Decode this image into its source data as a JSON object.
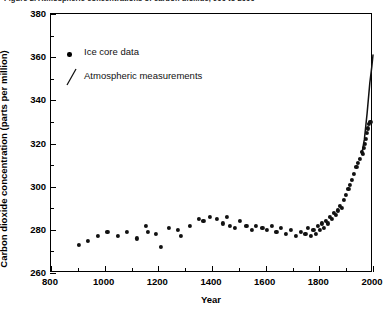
{
  "figure": {
    "title": "Figure 2. Atmospheric concentrations of carbon dioxide, 900 to 2000"
  },
  "legend": {
    "position": "top-left",
    "entries": [
      {
        "label": "Ice core data",
        "marker": "dot-marker-icon"
      },
      {
        "label": "Atmospheric measurements",
        "marker": "line-marker-icon"
      }
    ]
  },
  "axes": {
    "x": {
      "title": "Year",
      "min": 800,
      "max": 2000,
      "tick_labels": [
        "800",
        "1000",
        "1200",
        "1400",
        "1600",
        "1800",
        "2000"
      ],
      "major_ticks": [
        800,
        1000,
        1200,
        1400,
        1600,
        1800,
        2000
      ],
      "minor_ticks": [
        900,
        1100,
        1300,
        1500,
        1700,
        1900
      ]
    },
    "y": {
      "title": "Carbon dioxide concentration (parts per million)",
      "min": 260,
      "max": 380,
      "tick_labels": [
        "260",
        "280",
        "300",
        "320",
        "340",
        "360",
        "380"
      ],
      "major_ticks": [
        260,
        280,
        300,
        320,
        340,
        360,
        380
      ],
      "minor_ticks": [
        270,
        290,
        310,
        330,
        350,
        370
      ]
    }
  },
  "chart_data": {
    "type": "scatter",
    "title": "Figure 2. Atmospheric concentrations of carbon dioxide, 900 to 2000",
    "xlabel": "Year",
    "ylabel": "Carbon dioxide concentration (parts per million)",
    "xlim": [
      800,
      2000
    ],
    "ylim": [
      260,
      380
    ],
    "grid": false,
    "legend_position": "top-left",
    "series": [
      {
        "name": "Ice core data",
        "type": "scatter",
        "marker": "filled-circle",
        "color": "#111111",
        "points": [
          [
            905,
            273
          ],
          [
            938,
            275
          ],
          [
            975,
            277
          ],
          [
            1010,
            279
          ],
          [
            1048,
            277
          ],
          [
            1082,
            279
          ],
          [
            1120,
            276
          ],
          [
            1155,
            282
          ],
          [
            1162,
            279
          ],
          [
            1190,
            278
          ],
          [
            1210,
            272
          ],
          [
            1240,
            281
          ],
          [
            1272,
            280
          ],
          [
            1285,
            277
          ],
          [
            1318,
            282
          ],
          [
            1352,
            285
          ],
          [
            1368,
            284
          ],
          [
            1392,
            286
          ],
          [
            1418,
            285
          ],
          [
            1440,
            283
          ],
          [
            1455,
            286
          ],
          [
            1468,
            282
          ],
          [
            1485,
            281
          ],
          [
            1505,
            284
          ],
          [
            1528,
            282
          ],
          [
            1548,
            280
          ],
          [
            1565,
            282
          ],
          [
            1588,
            281
          ],
          [
            1605,
            280
          ],
          [
            1622,
            282
          ],
          [
            1640,
            279
          ],
          [
            1658,
            281
          ],
          [
            1675,
            278
          ],
          [
            1695,
            280
          ],
          [
            1712,
            277
          ],
          [
            1730,
            279
          ],
          [
            1748,
            278
          ],
          [
            1758,
            281
          ],
          [
            1768,
            277
          ],
          [
            1778,
            280
          ],
          [
            1788,
            278
          ],
          [
            1795,
            282
          ],
          [
            1802,
            280
          ],
          [
            1810,
            283
          ],
          [
            1818,
            281
          ],
          [
            1825,
            284
          ],
          [
            1832,
            283
          ],
          [
            1840,
            286
          ],
          [
            1848,
            285
          ],
          [
            1855,
            288
          ],
          [
            1862,
            287
          ],
          [
            1870,
            289
          ],
          [
            1878,
            291
          ],
          [
            1885,
            290
          ],
          [
            1892,
            294
          ],
          [
            1900,
            296
          ],
          [
            1908,
            299
          ],
          [
            1915,
            301
          ],
          [
            1922,
            303
          ],
          [
            1930,
            306
          ],
          [
            1938,
            309
          ],
          [
            1945,
            311
          ],
          [
            1952,
            313
          ],
          [
            1958,
            316
          ],
          [
            1962,
            315
          ],
          [
            1966,
            318
          ],
          [
            1970,
            320
          ],
          [
            1974,
            322
          ],
          [
            1978,
            325
          ],
          [
            1982,
            327
          ],
          [
            1986,
            329
          ],
          [
            1990,
            330
          ]
        ]
      },
      {
        "name": "Atmospheric measurements",
        "type": "line",
        "color": "#111111",
        "points": [
          [
            1958,
            315
          ],
          [
            1968,
            322
          ],
          [
            1978,
            334
          ],
          [
            1988,
            348
          ],
          [
            1996,
            356
          ],
          [
            2000,
            361
          ]
        ]
      }
    ]
  }
}
